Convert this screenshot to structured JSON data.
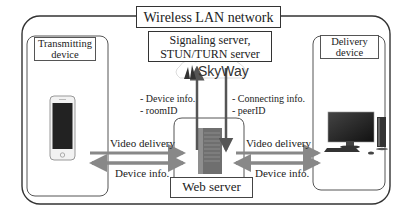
{
  "title": "Wireless LAN network",
  "signaling_server": {
    "line1": "Signaling server,",
    "line2": "STUN/TURN server"
  },
  "skyway": {
    "logo_text": "SkyWay"
  },
  "transmitting_device": {
    "line1": "Transmitting",
    "line2": "device"
  },
  "delivery_device": {
    "line1": "Delivery",
    "line2": "device"
  },
  "web_server": {
    "label": "Web server"
  },
  "uplink_info": {
    "line1": "- Device info.",
    "line2": "- roomID"
  },
  "downlink_info": {
    "line1": "- Connecting info.",
    "line2": "- peerID"
  },
  "left_links": {
    "top": "Video delivery",
    "bottom": "Device info."
  },
  "right_links": {
    "top": "Video delivery",
    "bottom": "Device info."
  },
  "colors": {
    "arrow": "#8a8a8a",
    "border": "#333333",
    "server": "#7a7a7a"
  }
}
